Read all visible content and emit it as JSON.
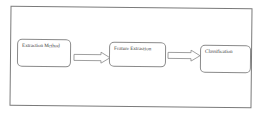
{
  "diagram": {
    "type": "flowchart",
    "direction": "left-to-right",
    "nodes": [
      {
        "id": "n1",
        "label": "Extraction Method"
      },
      {
        "id": "n2",
        "label": "Feature Extraction"
      },
      {
        "id": "n3",
        "label": "Classification"
      }
    ],
    "edges": [
      {
        "from": "n1",
        "to": "n2"
      },
      {
        "from": "n2",
        "to": "n3"
      }
    ]
  }
}
